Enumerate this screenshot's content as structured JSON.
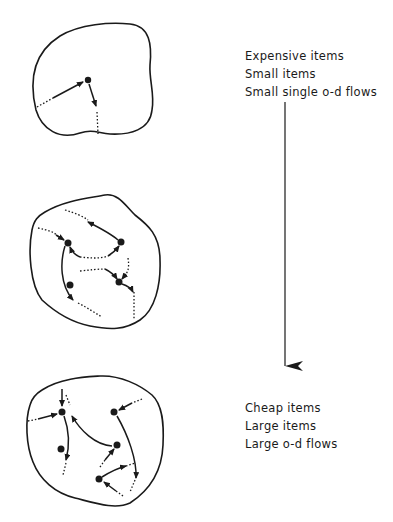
{
  "figure": {
    "panels": [
      {
        "id": "top",
        "description": "Region with one node and a single origin-destination flow pair"
      },
      {
        "id": "middle",
        "description": "Region with several nodes and moderate flows"
      },
      {
        "id": "bottom",
        "description": "Region with many nodes and dense flows"
      }
    ],
    "axis_arrow": {
      "direction": "down"
    },
    "top_labels": [
      "Expensive items",
      "Small items",
      "Small single o-d flows"
    ],
    "bottom_labels": [
      "Cheap items",
      "Large items",
      "Large o-d flows"
    ],
    "colors": {
      "ink": "#1a1a1a",
      "background": "#ffffff"
    }
  }
}
